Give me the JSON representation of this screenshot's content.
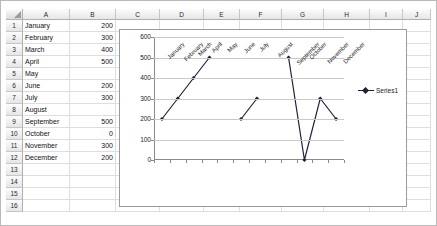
{
  "spreadsheet": {
    "column_headers": [
      "A",
      "B",
      "C",
      "D",
      "E",
      "F",
      "G",
      "H",
      "I",
      "J"
    ],
    "row_headers": [
      "1",
      "2",
      "3",
      "4",
      "5",
      "6",
      "7",
      "8",
      "9",
      "10",
      "11",
      "12",
      "13",
      "14",
      "15",
      "16"
    ],
    "corner_icon": "select-all-triangle-icon",
    "rows": [
      {
        "num": "1",
        "a": "January",
        "b": "200"
      },
      {
        "num": "2",
        "a": "February",
        "b": "300"
      },
      {
        "num": "3",
        "a": "March",
        "b": "400"
      },
      {
        "num": "4",
        "a": "April",
        "b": "500"
      },
      {
        "num": "5",
        "a": "May",
        "b": ""
      },
      {
        "num": "6",
        "a": "June",
        "b": "200"
      },
      {
        "num": "7",
        "a": "July",
        "b": "300"
      },
      {
        "num": "8",
        "a": "August",
        "b": ""
      },
      {
        "num": "9",
        "a": "September",
        "b": "500"
      },
      {
        "num": "10",
        "a": "October",
        "b": "0"
      },
      {
        "num": "11",
        "a": "November",
        "b": "300"
      },
      {
        "num": "12",
        "a": "December",
        "b": "200"
      },
      {
        "num": "13",
        "a": "",
        "b": ""
      },
      {
        "num": "14",
        "a": "",
        "b": ""
      },
      {
        "num": "15",
        "a": "",
        "b": ""
      },
      {
        "num": "16",
        "a": "",
        "b": ""
      }
    ]
  },
  "chart_data": {
    "type": "line",
    "title": "",
    "xlabel": "",
    "ylabel": "",
    "categories": [
      "January",
      "February",
      "March",
      "April",
      "May",
      "June",
      "July",
      "August",
      "September",
      "October",
      "November",
      "December"
    ],
    "series": [
      {
        "name": "Series1",
        "values": [
          200,
          300,
          400,
          500,
          null,
          200,
          300,
          null,
          500,
          0,
          300,
          200
        ]
      }
    ],
    "yticks": [
      0,
      100,
      200,
      300,
      400,
      500,
      600
    ],
    "ylim": [
      0,
      600
    ],
    "grid": true,
    "legend": "right",
    "legend_entries": [
      "Series1"
    ],
    "line_color": "#20203a",
    "marker": "diamond"
  }
}
